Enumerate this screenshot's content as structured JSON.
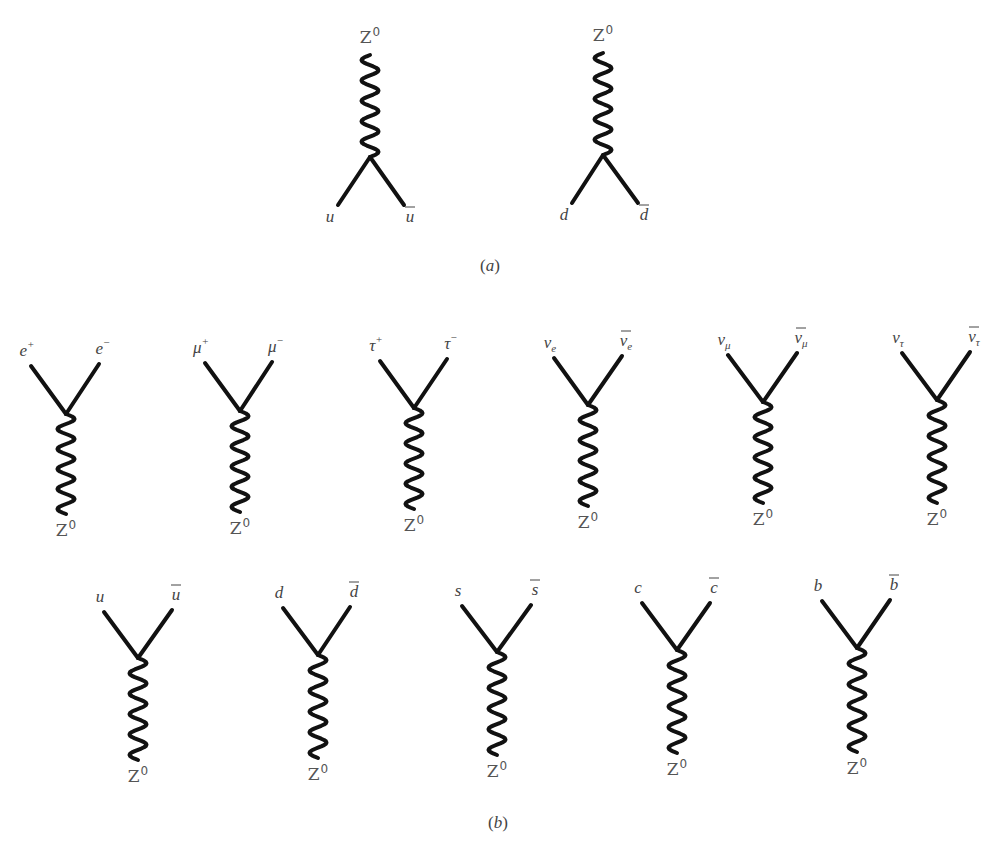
{
  "figure": {
    "panel_a": {
      "caption": "(a)",
      "caption_letter": "a",
      "caption_pos": [
        490,
        271
      ],
      "diagrams": [
        {
          "boson": "Z",
          "boson_sup": "0",
          "orientation": "up",
          "vertex": [
            370,
            157
          ],
          "wave_end": [
            370,
            55
          ],
          "left_end": [
            338,
            205
          ],
          "right_end": [
            404,
            205
          ],
          "left": {
            "symbol": "u",
            "bar": false,
            "sup": "",
            "sub": ""
          },
          "right": {
            "symbol": "u",
            "bar": true,
            "sup": "",
            "sub": ""
          }
        },
        {
          "boson": "Z",
          "boson_sup": "0",
          "orientation": "up",
          "vertex": [
            603,
            155
          ],
          "wave_end": [
            603,
            53
          ],
          "left_end": [
            572,
            203
          ],
          "right_end": [
            638,
            203
          ],
          "left": {
            "symbol": "d",
            "bar": false,
            "sup": "",
            "sub": ""
          },
          "right": {
            "symbol": "d",
            "bar": true,
            "sup": "",
            "sub": ""
          }
        }
      ]
    },
    "panel_b": {
      "caption": "(b)",
      "caption_letter": "b",
      "caption_pos": [
        498,
        828
      ],
      "diagrams": [
        {
          "boson": "Z",
          "boson_sup": "0",
          "orientation": "down",
          "vertex": [
            66,
            414
          ],
          "wave_end": [
            66,
            514
          ],
          "left_end": [
            31,
            366
          ],
          "right_end": [
            99,
            364
          ],
          "left": {
            "symbol": "e",
            "bar": false,
            "sup": "+",
            "sub": ""
          },
          "right": {
            "symbol": "e",
            "bar": false,
            "sup": "−",
            "sub": ""
          }
        },
        {
          "boson": "Z",
          "boson_sup": "0",
          "orientation": "down",
          "vertex": [
            240,
            411
          ],
          "wave_end": [
            240,
            512
          ],
          "left_end": [
            205,
            363
          ],
          "right_end": [
            272,
            362
          ],
          "left": {
            "symbol": "μ",
            "bar": false,
            "sup": "+",
            "sub": ""
          },
          "right": {
            "symbol": "μ",
            "bar": false,
            "sup": "−",
            "sub": ""
          }
        },
        {
          "boson": "Z",
          "boson_sup": "0",
          "orientation": "down",
          "vertex": [
            414,
            408
          ],
          "wave_end": [
            414,
            509
          ],
          "left_end": [
            380,
            361
          ],
          "right_end": [
            447,
            359
          ],
          "left": {
            "symbol": "τ",
            "bar": false,
            "sup": "+",
            "sub": ""
          },
          "right": {
            "symbol": "τ",
            "bar": false,
            "sup": "−",
            "sub": ""
          }
        },
        {
          "boson": "Z",
          "boson_sup": "0",
          "orientation": "down",
          "vertex": [
            588,
            405
          ],
          "wave_end": [
            588,
            506
          ],
          "left_end": [
            554,
            358
          ],
          "right_end": [
            622,
            356
          ],
          "left": {
            "symbol": "ν",
            "bar": false,
            "sup": "",
            "sub": "e"
          },
          "right": {
            "symbol": "ν",
            "bar": true,
            "sup": "",
            "sub": "e"
          }
        },
        {
          "boson": "Z",
          "boson_sup": "0",
          "orientation": "down",
          "vertex": [
            763,
            402
          ],
          "wave_end": [
            763,
            503
          ],
          "left_end": [
            728,
            355
          ],
          "right_end": [
            797,
            353
          ],
          "left": {
            "symbol": "ν",
            "bar": false,
            "sup": "",
            "sub": "μ"
          },
          "right": {
            "symbol": "ν",
            "bar": true,
            "sup": "",
            "sub": "μ"
          }
        },
        {
          "boson": "Z",
          "boson_sup": "0",
          "orientation": "down",
          "vertex": [
            937,
            400
          ],
          "wave_end": [
            937,
            503
          ],
          "left_end": [
            902,
            353
          ],
          "right_end": [
            970,
            352
          ],
          "left": {
            "symbol": "ν",
            "bar": false,
            "sup": "",
            "sub": "τ"
          },
          "right": {
            "symbol": "ν",
            "bar": true,
            "sup": "",
            "sub": "τ"
          }
        },
        {
          "boson": "Z",
          "boson_sup": "0",
          "orientation": "down",
          "vertex": [
            138,
            658
          ],
          "wave_end": [
            138,
            760
          ],
          "left_end": [
            104,
            612
          ],
          "right_end": [
            172,
            610
          ],
          "left": {
            "symbol": "u",
            "bar": false,
            "sup": "",
            "sub": ""
          },
          "right": {
            "symbol": "u",
            "bar": true,
            "sup": "",
            "sub": ""
          }
        },
        {
          "boson": "Z",
          "boson_sup": "0",
          "orientation": "down",
          "vertex": [
            318,
            655
          ],
          "wave_end": [
            318,
            758
          ],
          "left_end": [
            283,
            608
          ],
          "right_end": [
            350,
            607
          ],
          "left": {
            "symbol": "d",
            "bar": false,
            "sup": "",
            "sub": ""
          },
          "right": {
            "symbol": "d",
            "bar": true,
            "sup": "",
            "sub": ""
          }
        },
        {
          "boson": "Z",
          "boson_sup": "0",
          "orientation": "down",
          "vertex": [
            497,
            652
          ],
          "wave_end": [
            497,
            755
          ],
          "left_end": [
            462,
            606
          ],
          "right_end": [
            531,
            605
          ],
          "left": {
            "symbol": "s",
            "bar": false,
            "sup": "",
            "sub": ""
          },
          "right": {
            "symbol": "s",
            "bar": true,
            "sup": "",
            "sub": ""
          }
        },
        {
          "boson": "Z",
          "boson_sup": "0",
          "orientation": "down",
          "vertex": [
            677,
            650
          ],
          "wave_end": [
            677,
            753
          ],
          "left_end": [
            642,
            603
          ],
          "right_end": [
            710,
            603
          ],
          "left": {
            "symbol": "c",
            "bar": false,
            "sup": "",
            "sub": ""
          },
          "right": {
            "symbol": "c",
            "bar": true,
            "sup": "",
            "sub": ""
          }
        },
        {
          "boson": "Z",
          "boson_sup": "0",
          "orientation": "down",
          "vertex": [
            857,
            648
          ],
          "wave_end": [
            857,
            752
          ],
          "left_end": [
            822,
            601
          ],
          "right_end": [
            890,
            600
          ],
          "left": {
            "symbol": "b",
            "bar": false,
            "sup": "",
            "sub": ""
          },
          "right": {
            "symbol": "b",
            "bar": true,
            "sup": "",
            "sub": ""
          }
        }
      ]
    },
    "style": {
      "line_color": "#111111",
      "label_color": "#444444",
      "boson_label_color": "#555555",
      "background": "#ffffff"
    }
  }
}
